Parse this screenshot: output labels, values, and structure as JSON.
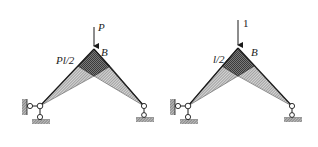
{
  "figures": [
    {
      "id": "real-load",
      "load_label": "P",
      "joint_label": "B",
      "moment_label": "Pl/2",
      "description": "Bending moment diagram of frame under load P at joint B"
    },
    {
      "id": "unit-load",
      "load_label": "1",
      "joint_label": "B",
      "moment_label": "l/2",
      "description": "Bending moment diagram of frame under unit load at joint B"
    }
  ],
  "colors": {
    "line": "#1a1a1a",
    "hatch_light": "#8c8c8c",
    "hatch_dark": "#4a4a4a",
    "ground": "#7a7a7a"
  }
}
